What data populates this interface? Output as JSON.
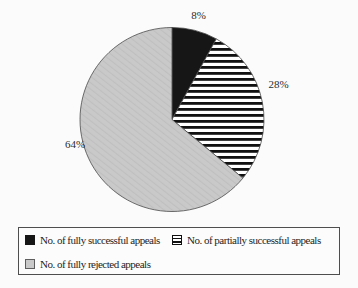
{
  "chart_data": {
    "type": "pie",
    "title": "",
    "categories": [
      "No. of fully successful appeals",
      "No. of partially successful appeals",
      "No. of fully rejected appeals"
    ],
    "values": [
      8,
      28,
      64
    ],
    "value_labels": [
      "8%",
      "28%",
      "64%"
    ],
    "unit": "percent",
    "start_angle_deg": 0,
    "direction": "clockwise",
    "legend_position": "bottom",
    "slice_styles": [
      "solid-black",
      "horizontal-stripes",
      "light-gray-diagonal-hatch"
    ],
    "colors": {
      "solid": "#161616",
      "stripe_ink": "#111111",
      "stripe_bg": "#ffffff",
      "gray_fill": "#c9c9c9",
      "gray_hatch": "#bfbfbf",
      "outline": "#4a4a4a",
      "label_text": "#2b2b2b"
    },
    "label_hints": [
      {
        "angle_deg": 14.4,
        "radius": 107
      },
      {
        "angle_deg": 72,
        "radius": 112
      },
      {
        "angle_deg": 255.5,
        "radius": 100
      }
    ]
  },
  "legend": {
    "border_color": "#4e4e4e",
    "rows": 2
  }
}
